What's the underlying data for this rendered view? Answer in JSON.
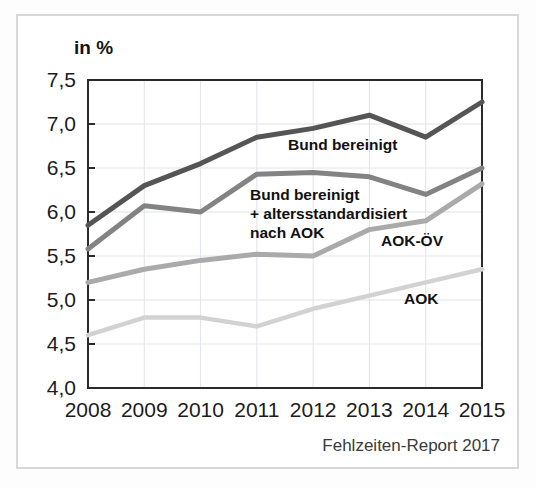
{
  "figure": {
    "axis_unit_label": "in %",
    "source_note": "Fehlzeiten-Report 2017"
  },
  "annotations": {
    "bund_bereinigt": "Bund bereinigt",
    "bund_standardisiert_line1": "Bund bereinigt",
    "bund_standardisiert_line2": "+ altersstandardisiert",
    "bund_standardisiert_line3": "nach AOK",
    "aok_oev": "AOK-ÖV",
    "aok": "AOK"
  },
  "colors": {
    "series_bund_bereinigt": "#555555",
    "series_bund_standardisiert": "#838383",
    "series_aok_oev": "#aaaaaa",
    "series_aok": "#d2d2d2",
    "grid": "#dfe3ea",
    "axis": "#2b2b2b",
    "frame": "#d8d8d8",
    "background": "#ffffff"
  },
  "chart_data": {
    "type": "line",
    "title": "",
    "subtitle": "",
    "xlabel": "",
    "ylabel": "in %",
    "categories": [
      "2008",
      "2009",
      "2010",
      "2011",
      "2012",
      "2013",
      "2014",
      "2015"
    ],
    "x": [
      2008,
      2009,
      2010,
      2011,
      2012,
      2013,
      2014,
      2015
    ],
    "ylim": [
      4.0,
      7.5
    ],
    "ytick_labels": [
      "4,0",
      "4,5",
      "5,0",
      "5,5",
      "6,0",
      "6,5",
      "7,0",
      "7,5"
    ],
    "yticks": [
      4.0,
      4.5,
      5.0,
      5.5,
      6.0,
      6.5,
      7.0,
      7.5
    ],
    "grid": true,
    "legend": "inline-annotations",
    "decimal_separator": ",",
    "series": [
      {
        "name": "Bund bereinigt",
        "color": "#555555",
        "values": [
          5.85,
          6.3,
          6.55,
          6.85,
          6.95,
          7.1,
          6.85,
          7.25
        ]
      },
      {
        "name": "Bund bereinigt + altersstandardisiert nach AOK",
        "color": "#838383",
        "values": [
          5.58,
          6.07,
          6.0,
          6.43,
          6.45,
          6.4,
          6.2,
          6.5
        ]
      },
      {
        "name": "AOK-ÖV",
        "color": "#aaaaaa",
        "values": [
          5.2,
          5.35,
          5.45,
          5.52,
          5.5,
          5.8,
          5.9,
          6.32
        ]
      },
      {
        "name": "AOK",
        "color": "#d2d2d2",
        "values": [
          4.6,
          4.8,
          4.8,
          4.7,
          4.9,
          5.05,
          5.2,
          5.35
        ]
      }
    ]
  }
}
